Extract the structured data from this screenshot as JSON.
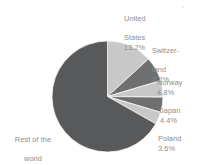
{
  "chart_data": {
    "type": "pie",
    "title": "",
    "subtitle": "",
    "xlabel": "",
    "ylabel": "",
    "legend_position": "callout-labels",
    "grid": false,
    "start_angle_deg": 0,
    "direction": "clockwise",
    "unit": "%",
    "categories": [
      "United States",
      "Switzerland",
      "Norway",
      "Japan",
      "Poland",
      "Rest of the world"
    ],
    "values": [
      13.2,
      7.2,
      4.8,
      4.4,
      3.6,
      66.8
    ],
    "slices": [
      {
        "label": "United States",
        "label_line1": "United",
        "label_line2": "States",
        "value": 13.2,
        "value_text": "13.2%",
        "color": "#c8c8c8"
      },
      {
        "label": "Switzerland",
        "label_line1": "Switzer-",
        "label_line2": "land",
        "value": 7.2,
        "value_text": "7.2%",
        "color": "#6e6f71"
      },
      {
        "label": "Norway",
        "label_line1": "Norway",
        "label_line2": "",
        "value": 4.8,
        "value_text": "4.8%",
        "color": "#c8c8c8"
      },
      {
        "label": "Japan",
        "label_line1": "Japan",
        "label_line2": "",
        "value": 4.4,
        "value_text": "4.4%",
        "color": "#6e6f71"
      },
      {
        "label": "Poland",
        "label_line1": "Poland",
        "label_line2": "",
        "value": 3.6,
        "value_text": "3.6%",
        "color": "#c8c8c8"
      },
      {
        "label": "Rest of the world",
        "label_line1": "Rest of the",
        "label_line2": "world",
        "value": 66.8,
        "value_text": "66.8%",
        "color": "#58595b"
      }
    ],
    "colors": {
      "light_slice": "#c8c8c8",
      "mid_slice": "#6e6f71",
      "dark_slice": "#58595b",
      "label_text": "#8d8d8d",
      "background": "#ffffff"
    }
  },
  "labels": {
    "united_states": {
      "line1": "United",
      "line2": "States",
      "pct": "13.2%"
    },
    "switzerland": {
      "line1": "Switzer-",
      "line2": "land",
      "pct": "7.2%"
    },
    "norway": {
      "line1": "Norway",
      "pct": "4.8%"
    },
    "japan": {
      "line1": "Japan",
      "pct": "4.4%"
    },
    "poland": {
      "line1": "Poland",
      "pct": "3.6%"
    },
    "rest": {
      "line1": "Rest of the",
      "line2": "world",
      "pct": "66.8%"
    }
  }
}
